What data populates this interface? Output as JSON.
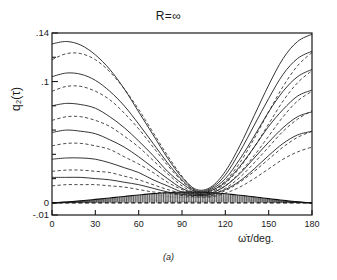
{
  "chart_data": {
    "type": "line",
    "title": "R=∞",
    "subtitle": "",
    "caption": "(a)",
    "xlabel": "ω̇τ/deg.",
    "ylabel": "q₂(τ)",
    "xlim": [
      0,
      180
    ],
    "ylim": [
      -0.01,
      0.14
    ],
    "grid": false,
    "legend": "none",
    "background_color": "#ffffff",
    "line_color": "#1e1e1e",
    "xticks": [
      0,
      30,
      60,
      90,
      120,
      150,
      180
    ],
    "xtick_labels": [
      "0",
      "30",
      "60",
      "90",
      "120",
      "150",
      "180"
    ],
    "yticks": [
      -0.01,
      0,
      0.1,
      0.14
    ],
    "ytick_labels": [
      "-.01",
      "0",
      ".1",
      ".14"
    ],
    "yticks_minor": [
      0.02,
      0.04,
      0.06,
      0.08,
      0.12
    ],
    "series": [
      {
        "name": "solid-1",
        "style": "solid",
        "x": [
          0,
          10,
          20,
          30,
          40,
          50,
          60,
          70,
          80,
          90,
          100,
          110,
          120,
          130,
          140,
          150,
          160,
          170,
          180
        ],
        "y": [
          0.131,
          0.133,
          0.13,
          0.122,
          0.11,
          0.094,
          0.075,
          0.056,
          0.037,
          0.021,
          0.011,
          0.013,
          0.026,
          0.047,
          0.072,
          0.097,
          0.119,
          0.133,
          0.139
        ]
      },
      {
        "name": "dashed-1",
        "style": "dashed",
        "x": [
          0,
          10,
          20,
          30,
          40,
          50,
          60,
          70,
          80,
          90,
          100,
          110,
          120,
          130,
          140,
          150,
          160,
          170,
          180
        ],
        "y": [
          0.118,
          0.123,
          0.123,
          0.118,
          0.108,
          0.094,
          0.077,
          0.058,
          0.039,
          0.022,
          0.01,
          0.01,
          0.018,
          0.033,
          0.053,
          0.075,
          0.096,
          0.113,
          0.124
        ]
      },
      {
        "name": "solid-2",
        "style": "solid",
        "x": [
          0,
          10,
          20,
          30,
          40,
          50,
          60,
          70,
          80,
          90,
          100,
          110,
          120,
          130,
          140,
          150,
          160,
          170,
          180
        ],
        "y": [
          0.104,
          0.107,
          0.106,
          0.101,
          0.092,
          0.08,
          0.065,
          0.049,
          0.033,
          0.019,
          0.01,
          0.012,
          0.023,
          0.042,
          0.064,
          0.086,
          0.106,
          0.119,
          0.125
        ]
      },
      {
        "name": "dashed-2",
        "style": "dashed",
        "x": [
          0,
          10,
          20,
          30,
          40,
          50,
          60,
          70,
          80,
          90,
          100,
          110,
          120,
          130,
          140,
          150,
          160,
          170,
          180
        ],
        "y": [
          0.092,
          0.096,
          0.096,
          0.092,
          0.085,
          0.074,
          0.061,
          0.046,
          0.031,
          0.018,
          0.009,
          0.009,
          0.016,
          0.029,
          0.046,
          0.065,
          0.084,
          0.099,
          0.109
        ]
      },
      {
        "name": "solid-3",
        "style": "solid",
        "x": [
          0,
          10,
          20,
          30,
          40,
          50,
          60,
          70,
          80,
          90,
          100,
          110,
          120,
          130,
          140,
          150,
          160,
          170,
          180
        ],
        "y": [
          0.08,
          0.082,
          0.081,
          0.078,
          0.071,
          0.062,
          0.051,
          0.039,
          0.026,
          0.016,
          0.009,
          0.011,
          0.02,
          0.036,
          0.055,
          0.075,
          0.092,
          0.104,
          0.11
        ]
      },
      {
        "name": "dashed-3",
        "style": "dashed",
        "x": [
          0,
          10,
          20,
          30,
          40,
          50,
          60,
          70,
          80,
          90,
          100,
          110,
          120,
          130,
          140,
          150,
          160,
          170,
          180
        ],
        "y": [
          0.068,
          0.071,
          0.071,
          0.068,
          0.063,
          0.055,
          0.046,
          0.035,
          0.024,
          0.014,
          0.008,
          0.008,
          0.014,
          0.025,
          0.039,
          0.055,
          0.071,
          0.084,
          0.092
        ]
      },
      {
        "name": "solid-4",
        "style": "solid",
        "x": [
          0,
          10,
          20,
          30,
          40,
          50,
          60,
          70,
          80,
          90,
          100,
          110,
          120,
          130,
          140,
          150,
          160,
          170,
          180
        ],
        "y": [
          0.058,
          0.06,
          0.059,
          0.057,
          0.052,
          0.046,
          0.038,
          0.029,
          0.02,
          0.012,
          0.008,
          0.01,
          0.017,
          0.03,
          0.046,
          0.063,
          0.077,
          0.088,
          0.093
        ]
      },
      {
        "name": "dashed-4",
        "style": "dashed",
        "x": [
          0,
          10,
          20,
          30,
          40,
          50,
          60,
          70,
          80,
          90,
          100,
          110,
          120,
          130,
          140,
          150,
          160,
          170,
          180
        ],
        "y": [
          0.047,
          0.049,
          0.049,
          0.047,
          0.044,
          0.038,
          0.032,
          0.025,
          0.017,
          0.011,
          0.007,
          0.007,
          0.012,
          0.021,
          0.033,
          0.046,
          0.059,
          0.069,
          0.076
        ]
      },
      {
        "name": "solid-5",
        "style": "solid",
        "x": [
          0,
          10,
          20,
          30,
          40,
          50,
          60,
          70,
          80,
          90,
          100,
          110,
          120,
          130,
          140,
          150,
          160,
          170,
          180
        ],
        "y": [
          0.036,
          0.037,
          0.037,
          0.036,
          0.033,
          0.029,
          0.025,
          0.019,
          0.014,
          0.009,
          0.007,
          0.008,
          0.014,
          0.024,
          0.037,
          0.05,
          0.062,
          0.071,
          0.075
        ]
      },
      {
        "name": "dashed-5",
        "style": "dashed",
        "x": [
          0,
          10,
          20,
          30,
          40,
          50,
          60,
          70,
          80,
          90,
          100,
          110,
          120,
          130,
          140,
          150,
          160,
          170,
          180
        ],
        "y": [
          0.026,
          0.027,
          0.027,
          0.026,
          0.025,
          0.022,
          0.019,
          0.015,
          0.011,
          0.008,
          0.006,
          0.006,
          0.01,
          0.017,
          0.026,
          0.036,
          0.046,
          0.054,
          0.059
        ]
      },
      {
        "name": "solid-6",
        "style": "solid",
        "x": [
          0,
          10,
          20,
          30,
          40,
          50,
          60,
          70,
          80,
          90,
          100,
          110,
          120,
          130,
          140,
          150,
          160,
          170,
          180
        ],
        "y": [
          0.021,
          0.021,
          0.021,
          0.02,
          0.019,
          0.017,
          0.015,
          0.012,
          0.009,
          0.007,
          0.006,
          0.007,
          0.011,
          0.018,
          0.028,
          0.039,
          0.049,
          0.056,
          0.059
        ]
      },
      {
        "name": "dashed-6",
        "style": "dashed",
        "x": [
          0,
          10,
          20,
          30,
          40,
          50,
          60,
          70,
          80,
          90,
          100,
          110,
          120,
          130,
          140,
          150,
          160,
          170,
          180
        ],
        "y": [
          0.014,
          0.015,
          0.015,
          0.015,
          0.014,
          0.013,
          0.011,
          0.009,
          0.008,
          0.006,
          0.005,
          0.005,
          0.008,
          0.013,
          0.02,
          0.028,
          0.036,
          0.042,
          0.046
        ]
      }
    ],
    "band": {
      "name": "dense-hatched-lens",
      "description": "dense band of short vertical hatch strokes hugging the baseline",
      "x_start": 0,
      "x_end": 180,
      "peak_x": 105,
      "peak_y": 0.009,
      "baseline_y": 0.0
    },
    "annotations": []
  }
}
